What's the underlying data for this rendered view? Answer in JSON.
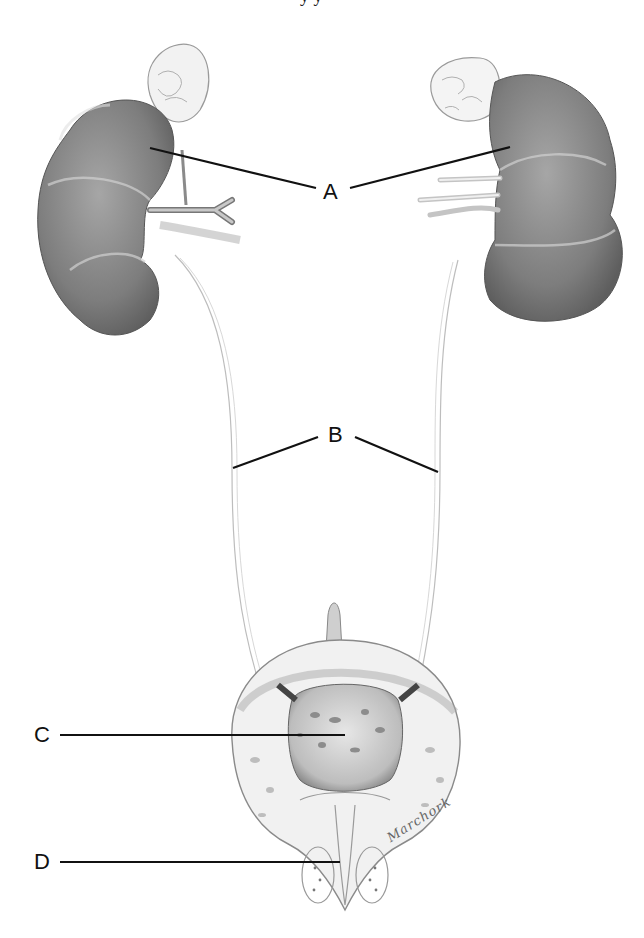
{
  "figure": {
    "type": "anatomical-illustration",
    "top_caption_fragment": "y y",
    "signature": "Marchork"
  },
  "labels": [
    {
      "id": "A",
      "text": "A",
      "x": 323,
      "y": 192,
      "targets": [
        "left-kidney",
        "right-kidney"
      ]
    },
    {
      "id": "B",
      "text": "B",
      "x": 330,
      "y": 436,
      "targets": [
        "left-ureter",
        "right-ureter"
      ]
    },
    {
      "id": "C",
      "text": "C",
      "x": 42,
      "y": 735,
      "targets": [
        "bladder"
      ]
    },
    {
      "id": "D",
      "text": "D",
      "x": 42,
      "y": 860,
      "targets": [
        "urethra"
      ]
    }
  ],
  "colors": {
    "background": "#ffffff",
    "leader_line": "#111111",
    "kidney_fill": "#8a8a8a",
    "kidney_shadow": "#6a6a6a",
    "sketch_line": "#aaaaaa",
    "bladder_fill": "#d8d8d8"
  }
}
